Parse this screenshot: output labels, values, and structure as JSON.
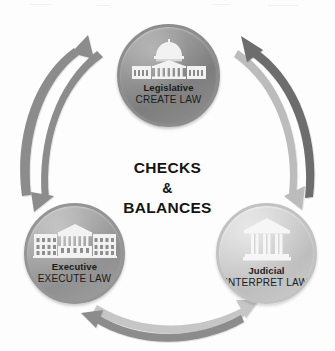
{
  "diagram": {
    "title": "Checks & Balances",
    "center_label": {
      "line1": "CHECKS",
      "line2": "&",
      "line3": "BALANCES"
    },
    "nodes": [
      {
        "id": "legislative",
        "title": "Legislative",
        "subtitle": "CREATE LAW",
        "icon": "capitol-building-icon",
        "fill": "#8f8f8f",
        "border": "#8d8d8d"
      },
      {
        "id": "executive",
        "title": "Executive",
        "subtitle": "EXECUTE LAW",
        "icon": "white-house-icon",
        "fill": "#a2a2a2",
        "border": "#959595"
      },
      {
        "id": "judicial",
        "title": "Judicial",
        "subtitle": "INTERPRET LAW",
        "icon": "courthouse-icon",
        "fill": "#c9c9c9",
        "border": "#c2c2c2"
      }
    ],
    "arrows": [
      {
        "id": "executive-to-legislative",
        "from": "executive",
        "to": "legislative",
        "side": "left",
        "color": "#8c8c8c"
      },
      {
        "id": "legislative-to-executive",
        "from": "legislative",
        "to": "executive",
        "side": "left",
        "color": "#8c8c8c"
      },
      {
        "id": "judicial-to-legislative",
        "from": "judicial",
        "to": "legislative",
        "side": "right",
        "color": "#6d6d6d"
      },
      {
        "id": "legislative-to-judicial",
        "from": "legislative",
        "to": "judicial",
        "side": "right",
        "color": "#bcbcbc"
      },
      {
        "id": "executive-to-judicial",
        "from": "executive",
        "to": "judicial",
        "side": "bottom",
        "color": "#c6c6c6"
      },
      {
        "id": "judicial-to-executive",
        "from": "judicial",
        "to": "executive",
        "side": "bottom",
        "color": "#8c8c8c"
      }
    ],
    "colors": {
      "background": "#fdfdfd",
      "text": "#1b1b1b",
      "center_text": "#141414",
      "icon": "#f4f4f4"
    }
  }
}
